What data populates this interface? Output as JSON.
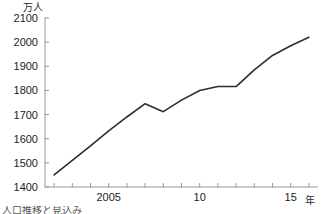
{
  "chart_data": {
    "type": "line",
    "title": "",
    "subtitle": "",
    "xlabel": "年",
    "ylabel": "万人",
    "y_unit_label": "万人",
    "x_unit_label": "年",
    "xlim": [
      2001.5,
      2016.5
    ],
    "ylim": [
      1400,
      2100
    ],
    "y_ticks": [
      2100,
      2000,
      1900,
      1800,
      1700,
      1600,
      1500,
      1400
    ],
    "y_tick_labels": [
      "2100",
      "2000",
      "1900",
      "1800",
      "1700",
      "1600",
      "1500",
      "1400"
    ],
    "x_ticks": [
      2002,
      2003,
      2004,
      2005,
      2006,
      2007,
      2008,
      2009,
      2010,
      2011,
      2012,
      2013,
      2014,
      2015,
      2016
    ],
    "x_tick_labels": [
      "",
      "",
      "",
      "2005",
      "",
      "",
      "",
      "",
      "10",
      "",
      "",
      "",
      "",
      "15",
      ""
    ],
    "x_labeled_ticks": [
      {
        "value": 2005,
        "label": "2005"
      },
      {
        "value": 2010,
        "label": "10"
      },
      {
        "value": 2015,
        "label": "15"
      }
    ],
    "grid": false,
    "legend": false,
    "legend_position": "none",
    "line_color": "#2e2e2e",
    "axis_color": "#9a9a9a",
    "background_color": "#ffffff",
    "series": [
      {
        "name": "人口",
        "color": "#2e2e2e",
        "x": [
          2002,
          2003,
          2004,
          2005,
          2006,
          2007,
          2008,
          2009,
          2010,
          2011,
          2012,
          2013,
          2014,
          2015,
          2016
        ],
        "values": [
          1450,
          1510,
          1570,
          1632,
          1690,
          1745,
          1712,
          1760,
          1800,
          1816,
          1816,
          1885,
          1945,
          1985,
          2020
        ]
      }
    ],
    "annotations": []
  },
  "caption": {
    "text": "人口推移と見込み"
  }
}
